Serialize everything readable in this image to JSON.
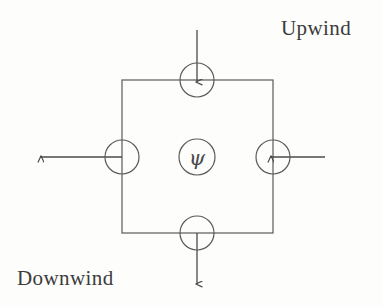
{
  "figure": {
    "background_color": "#fdfdfc",
    "ink_color": "#4a4a4a",
    "labels": {
      "upwind": "Upwind",
      "downwind": "Downwind"
    },
    "center_node": {
      "symbol": "ψ",
      "name": "psi"
    },
    "cell": {
      "shape": "square",
      "left": 122,
      "top": 80,
      "right": 273,
      "bottom": 233,
      "stroke_width": 1.2
    },
    "face_nodes": [
      {
        "name": "north-face-node",
        "cx": 197,
        "cy": 80,
        "r": 17
      },
      {
        "name": "south-face-node",
        "cx": 197,
        "cy": 233,
        "r": 17
      },
      {
        "name": "west-face-node",
        "cx": 122,
        "cy": 157,
        "r": 17
      },
      {
        "name": "east-face-node",
        "cx": 273,
        "cy": 157,
        "r": 17
      }
    ],
    "center_circle": {
      "cx": 197,
      "cy": 157,
      "r": 18
    },
    "arrows": [
      {
        "name": "north-inflow-arrow",
        "direction": "down",
        "flow": "inflow",
        "x1": 197,
        "y1": 30,
        "x2": 197,
        "y2": 80
      },
      {
        "name": "east-inflow-arrow",
        "direction": "left",
        "flow": "inflow",
        "x1": 325,
        "y1": 157,
        "x2": 273,
        "y2": 157
      },
      {
        "name": "west-outflow-arrow",
        "direction": "left",
        "flow": "outflow",
        "x1": 122,
        "y1": 157,
        "x2": 40,
        "y2": 157
      },
      {
        "name": "south-outflow-arrow",
        "direction": "down",
        "flow": "outflow",
        "x1": 197,
        "y1": 233,
        "x2": 197,
        "y2": 285
      }
    ]
  }
}
